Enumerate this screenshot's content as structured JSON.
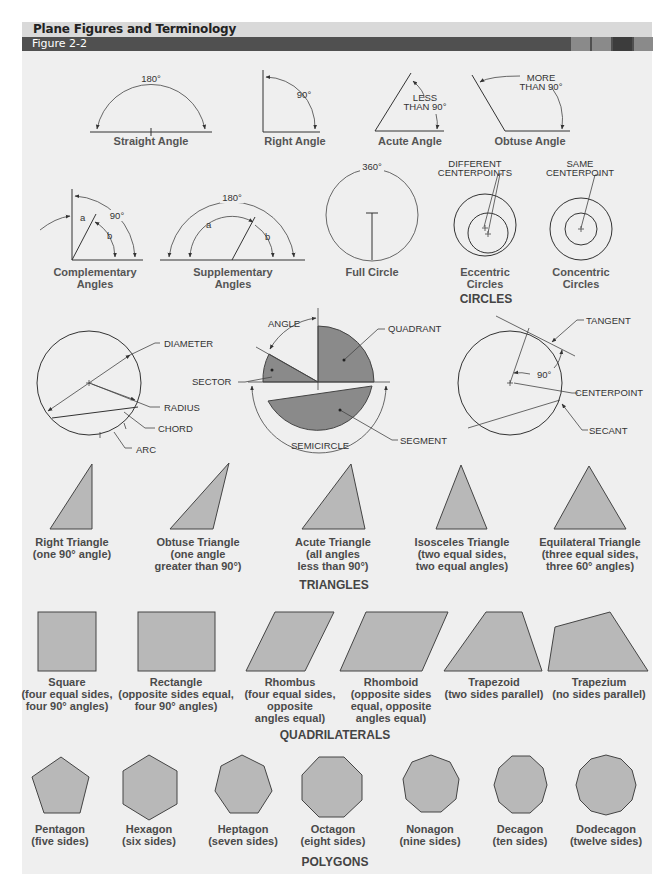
{
  "header": {
    "title": "Plane Figures and Terminology",
    "figure_label": "Figure 2-2",
    "accent_squares": [
      "#8a8a8a",
      "#8a8a8a",
      "#3c3c3c",
      "#8a8a8a"
    ]
  },
  "angles": {
    "straight": {
      "label": "Straight Angle",
      "measure": "180°"
    },
    "right": {
      "label": "Right Angle",
      "measure": "90°"
    },
    "acute": {
      "label": "Acute Angle",
      "note_line1": "LESS",
      "note_line2": "THAN 90°"
    },
    "obtuse": {
      "label": "Obtuse Angle",
      "note_line1": "MORE",
      "note_line2": "THAN 90°"
    },
    "complementary": {
      "label_line1": "Complementary",
      "label_line2": "Angles",
      "measure": "90°",
      "a": "a",
      "b": "b"
    },
    "supplementary": {
      "label_line1": "Supplementary",
      "label_line2": "Angles",
      "measure": "180°",
      "a": "a",
      "b": "b"
    }
  },
  "circles": {
    "section_title": "CIRCLES",
    "full": {
      "label": "Full Circle",
      "measure": "360°"
    },
    "eccentric": {
      "label_line1": "Eccentric",
      "label_line2": "Circles",
      "note_line1": "DIFFERENT",
      "note_line2": "CENTERPOINTS"
    },
    "concentric": {
      "label_line1": "Concentric",
      "label_line2": "Circles",
      "note_line1": "SAME",
      "note_line2": "CENTERPOINT"
    },
    "parts": {
      "diameter": "DIAMETER",
      "radius": "RADIUS",
      "chord": "CHORD",
      "arc": "ARC",
      "angle": "ANGLE",
      "sector": "SECTOR",
      "quadrant": "QUADRANT",
      "semicircle": "SEMICIRCLE",
      "segment": "SEGMENT",
      "tangent": "TANGENT",
      "right_angle": "90°",
      "centerpoint": "CENTERPOINT",
      "secant": "SECANT"
    }
  },
  "triangles": {
    "section_title": "TRIANGLES",
    "items": [
      {
        "name": "Right Triangle",
        "desc1": "(one 90° angle)",
        "desc2": ""
      },
      {
        "name": "Obtuse Triangle",
        "desc1": "(one angle",
        "desc2": "greater than 90°)"
      },
      {
        "name": "Acute Triangle",
        "desc1": "(all angles",
        "desc2": "less than 90°)"
      },
      {
        "name": "Isosceles Triangle",
        "desc1": "(two equal sides,",
        "desc2": "two equal angles)"
      },
      {
        "name": "Equilateral Triangle",
        "desc1": "(three equal sides,",
        "desc2": "three 60° angles)"
      }
    ]
  },
  "quadrilaterals": {
    "section_title": "QUADRILATERALS",
    "items": [
      {
        "name": "Square",
        "desc1": "(four equal sides,",
        "desc2": "four 90° angles)",
        "desc3": ""
      },
      {
        "name": "Rectangle",
        "desc1": "(opposite sides equal,",
        "desc2": "four 90° angles)",
        "desc3": ""
      },
      {
        "name": "Rhombus",
        "desc1": "(four equal sides,",
        "desc2": "opposite",
        "desc3": "angles equal)"
      },
      {
        "name": "Rhomboid",
        "desc1": "(opposite sides",
        "desc2": "equal, opposite",
        "desc3": "angles equal)"
      },
      {
        "name": "Trapezoid",
        "desc1": "(two sides parallel)",
        "desc2": "",
        "desc3": ""
      },
      {
        "name": "Trapezium",
        "desc1": "(no sides parallel)",
        "desc2": "",
        "desc3": ""
      }
    ]
  },
  "polygons": {
    "section_title": "POLYGONS",
    "items": [
      {
        "name": "Pentagon",
        "desc": "(five sides)",
        "sides": 5
      },
      {
        "name": "Hexagon",
        "desc": "(six sides)",
        "sides": 6
      },
      {
        "name": "Heptagon",
        "desc": "(seven sides)",
        "sides": 7
      },
      {
        "name": "Octagon",
        "desc": "(eight sides)",
        "sides": 8
      },
      {
        "name": "Nonagon",
        "desc": "(nine sides)",
        "sides": 9
      },
      {
        "name": "Decagon",
        "desc": "(ten sides)",
        "sides": 10
      },
      {
        "name": "Dodecagon",
        "desc": "(twelve sides)",
        "sides": 12
      }
    ]
  }
}
